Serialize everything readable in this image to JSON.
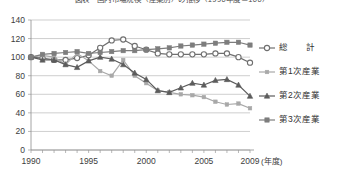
{
  "chart_title": "図表　国内市場規模（産業別）の推移（1990年度＝100）",
  "axes": {
    "x_label": "(年度)",
    "x_ticks": [
      "1990",
      "1995",
      "2000",
      "2005",
      "2009"
    ],
    "y_ticks": [
      "0",
      "20",
      "40",
      "60",
      "80",
      "100",
      "120",
      "140"
    ]
  },
  "legend": {
    "items": [
      {
        "label": "総　　計",
        "marker": "open-circle",
        "color": "#6f6f6f"
      },
      {
        "label": "第1次産業",
        "marker": "small-square",
        "color": "#a8a8a8"
      },
      {
        "label": "第2次産業",
        "marker": "triangle",
        "color": "#5c5c5c"
      },
      {
        "label": "第3次産業",
        "marker": "square",
        "color": "#7d7d7d"
      }
    ]
  },
  "chart_data": {
    "type": "line",
    "title": "図表　国内市場規模（産業別）の推移（1990年度＝100）",
    "xlabel": "(年度)",
    "ylabel": "",
    "xlim": [
      1990,
      2009
    ],
    "ylim": [
      0,
      140
    ],
    "grid": true,
    "legend_position": "right",
    "x": [
      1990,
      1991,
      1992,
      1993,
      1994,
      1995,
      1996,
      1997,
      1998,
      1999,
      2000,
      2001,
      2002,
      2003,
      2004,
      2005,
      2006,
      2007,
      2008,
      2009
    ],
    "series": [
      {
        "name": "総　　計",
        "marker": "open-circle",
        "color": "#6f6f6f",
        "values": [
          100,
          99,
          97,
          97,
          99,
          102,
          110,
          118,
          119,
          112,
          108,
          104,
          103,
          103,
          103,
          103,
          104,
          104,
          100,
          94
        ]
      },
      {
        "name": "第1次産業",
        "marker": "small-square",
        "color": "#a8a8a8",
        "values": [
          100,
          102,
          100,
          92,
          104,
          96,
          85,
          80,
          97,
          80,
          72,
          64,
          62,
          60,
          59,
          57,
          52,
          49,
          50,
          45
        ]
      },
      {
        "name": "第2次産業",
        "marker": "triangle",
        "color": "#5c5c5c",
        "values": [
          100,
          97,
          97,
          92,
          89,
          96,
          100,
          98,
          92,
          83,
          76,
          64,
          62,
          67,
          72,
          70,
          75,
          76,
          70,
          58
        ]
      },
      {
        "name": "第3次産業",
        "marker": "square",
        "color": "#7d7d7d",
        "values": [
          100,
          103,
          104,
          105,
          106,
          104,
          105,
          106,
          107,
          107,
          108,
          109,
          110,
          112,
          113,
          114,
          115,
          116,
          116,
          113
        ]
      }
    ]
  }
}
